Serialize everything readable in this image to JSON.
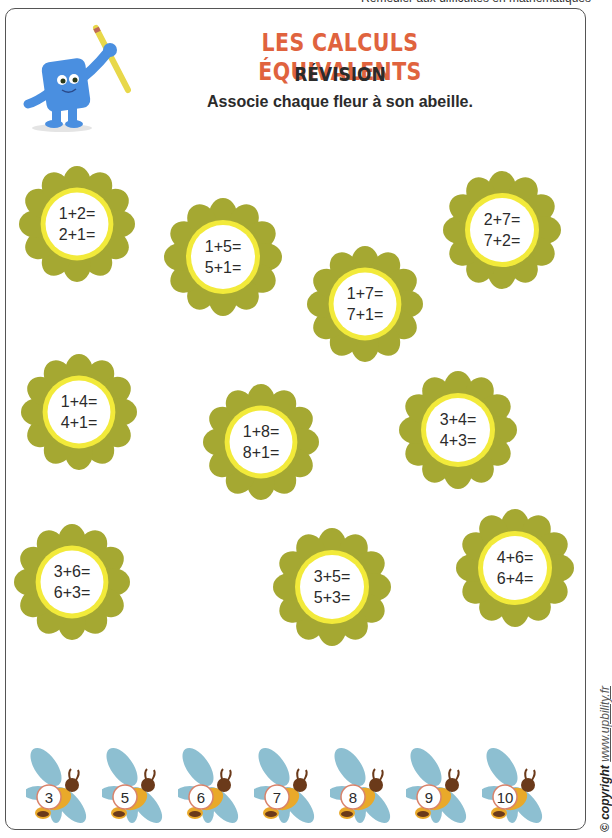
{
  "header": {
    "top_caption": "Remédier aux difficultés en mathématiques",
    "title": "LES CALCULS ÉQUIVALENTS",
    "subtitle": "RÉVISION",
    "instruction": "Associe chaque fleur à son abeille."
  },
  "mascot": {
    "icon": "blue-square-character-with-pencil-icon"
  },
  "colors": {
    "title": "#e0633e",
    "petal": "#a5a832",
    "ring": "#f2ea3a",
    "bee_wing": "#8dbfd1",
    "bee_body": "#e9a92a",
    "bee_head": "#6b3a1a",
    "bee_badge_border": "#d9826a"
  },
  "flowers": [
    {
      "line1": "1+2=",
      "line2": "2+1="
    },
    {
      "line1": "1+5=",
      "line2": "5+1="
    },
    {
      "line1": "1+7=",
      "line2": "7+1="
    },
    {
      "line1": "2+7=",
      "line2": "7+2="
    },
    {
      "line1": "1+4=",
      "line2": "4+1="
    },
    {
      "line1": "1+8=",
      "line2": "8+1="
    },
    {
      "line1": "3+4=",
      "line2": "4+3="
    },
    {
      "line1": "3+6=",
      "line2": "6+3="
    },
    {
      "line1": "3+5=",
      "line2": "5+3="
    },
    {
      "line1": "4+6=",
      "line2": "6+4="
    }
  ],
  "bees": [
    {
      "number": "3"
    },
    {
      "number": "5"
    },
    {
      "number": "6"
    },
    {
      "number": "7"
    },
    {
      "number": "8"
    },
    {
      "number": "9"
    },
    {
      "number": "10"
    }
  ],
  "footer": {
    "copyright_label": "© copyright",
    "copyright_url": "www.upbility.fr"
  }
}
